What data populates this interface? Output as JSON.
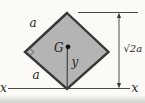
{
  "diagram": {
    "labels": {
      "side_upper": "a",
      "side_lower": "a",
      "centroid": "G",
      "axis_y": "y",
      "axis_x_left": "x",
      "axis_x_right": "x",
      "dimension_height": "√2a"
    },
    "colors": {
      "shape_fill": "#b4b4b4",
      "shape_stroke": "#383838",
      "line": "#4a4a4a",
      "text": "#262626",
      "background": "#fbfaf6"
    }
  }
}
